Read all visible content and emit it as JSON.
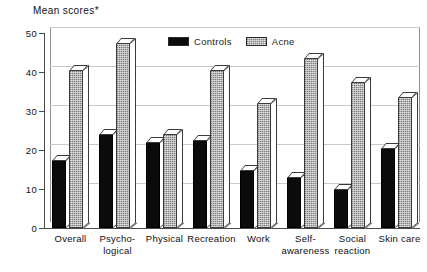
{
  "chart_data": {
    "type": "bar",
    "title": "Mean scores*",
    "xlabel": "",
    "ylabel": "Mean scores*",
    "ylim": [
      0,
      50
    ],
    "yticks": [
      0,
      10,
      20,
      30,
      40,
      50
    ],
    "grid": true,
    "legend_position": "top-center",
    "categories": [
      "Overall",
      "Psycho-\nlogical",
      "Physical",
      "Recreation",
      "Work",
      "Self-\nawareness",
      "Social\nreaction",
      "Skin care"
    ],
    "series": [
      {
        "name": "Controls",
        "color": "#0b0b0b",
        "values": [
          17.5,
          24,
          22,
          22.5,
          15,
          13,
          10,
          20.5
        ]
      },
      {
        "name": "Acne",
        "color": "#b4b4b4",
        "values": [
          40.5,
          47.5,
          24,
          40.5,
          32,
          43.5,
          37.5,
          33.5
        ]
      }
    ]
  },
  "axis": {
    "title": "Mean scores*",
    "tick_labels": [
      "50",
      "40",
      "30",
      "20",
      "10",
      "0"
    ]
  },
  "legend": {
    "items": [
      {
        "label": "Controls",
        "swatch": "black-filled-swatch"
      },
      {
        "label": "Acne",
        "swatch": "gray-hatched-swatch"
      }
    ]
  },
  "xaxis": {
    "labels": [
      {
        "line1": "Overall",
        "line2": ""
      },
      {
        "line1": "Psycho-",
        "line2": "logical"
      },
      {
        "line1": "Physical",
        "line2": ""
      },
      {
        "line1": "Recreation",
        "line2": ""
      },
      {
        "line1": "Work",
        "line2": ""
      },
      {
        "line1": "Self-",
        "line2": "awareness"
      },
      {
        "line1": "Social",
        "line2": "reaction"
      },
      {
        "line1": "Skin care",
        "line2": ""
      }
    ]
  }
}
